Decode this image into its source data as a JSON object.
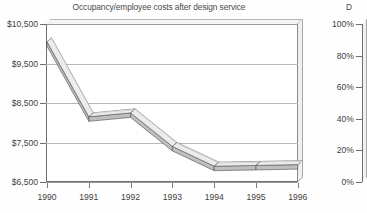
{
  "chart_data": [
    {
      "type": "line",
      "title": "Occupancy/employee costs after design service",
      "xlabel": "",
      "ylabel": "",
      "categories": [
        "1990",
        "1991",
        "1992",
        "1993",
        "1994",
        "1995",
        "1996"
      ],
      "values": [
        10050,
        8150,
        8250,
        7400,
        6900,
        6920,
        6940
      ],
      "ylim": [
        6500,
        10500
      ],
      "yticks": [
        6500,
        7500,
        8500,
        9500,
        10500
      ],
      "ytick_labels": [
        "$6,500",
        "$7,500",
        "$8,500",
        "$9,500",
        "$10,500"
      ],
      "grid": true,
      "legend": "none",
      "style_3d": true,
      "series_color": "#d6d6d6",
      "series_edge_color": "#4f4f4f"
    },
    {
      "type": "line",
      "title": "D",
      "note": "second chart clipped at right edge of screenshot",
      "ylim": [
        0,
        100
      ],
      "yticks": [
        0,
        20,
        40,
        60,
        80,
        100
      ],
      "ytick_labels": [
        "0%",
        "20%",
        "40%",
        "60%",
        "80%",
        "100%"
      ],
      "categories": [],
      "values": [],
      "grid": false,
      "legend": "none"
    }
  ],
  "main_chart": {
    "title": "Occupancy/employee costs after design service",
    "y_axis": {
      "labels": [
        "$10,500",
        "$9,500",
        "$8,500",
        "$7,500",
        "$6,500"
      ]
    },
    "x_axis": {
      "labels": [
        "1990",
        "1991",
        "1992",
        "1993",
        "1994",
        "1995",
        "1996"
      ]
    }
  },
  "right_chart": {
    "title_fragment": "D",
    "y_axis": {
      "labels": [
        "100%",
        "80%",
        "60%",
        "40%",
        "20%",
        "0%"
      ]
    }
  },
  "colors": {
    "background": "#fefefe",
    "plot_background": "#ffffff",
    "gridline": "#b9b9b9",
    "axis": "#6e6e6e",
    "text": "#3f3f3f",
    "ribbon_fill": "#d6d6d6",
    "ribbon_edge": "#4f4f4f"
  }
}
